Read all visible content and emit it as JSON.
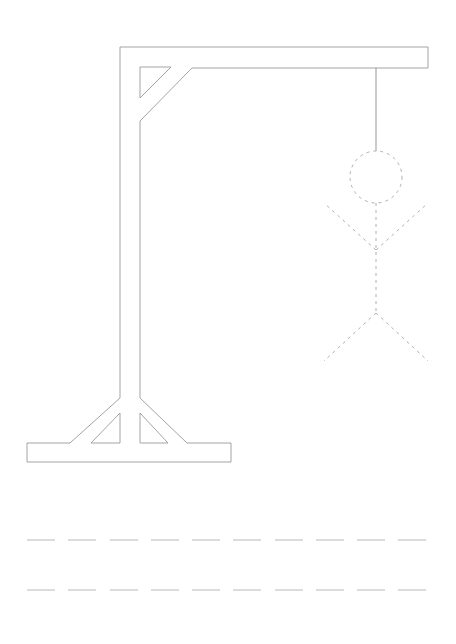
{
  "game": {
    "type": "hangman",
    "colors": {
      "gallows": "#9a9a9a",
      "figure": "#b0b0b0",
      "blanks": "#b8b8b8",
      "background": "#ffffff"
    },
    "figure_parts": [
      "head",
      "torso",
      "left-arm",
      "right-arm",
      "left-leg",
      "right-leg"
    ],
    "figure_style": "dashed",
    "word_rows": [
      {
        "blanks": 10,
        "letters": [
          "",
          "",
          "",
          "",
          "",
          "",
          "",
          "",
          "",
          ""
        ]
      },
      {
        "blanks": 10,
        "letters": [
          "",
          "",
          "",
          "",
          "",
          "",
          "",
          "",
          "",
          ""
        ]
      }
    ]
  }
}
